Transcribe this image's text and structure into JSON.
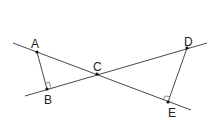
{
  "diagram": {
    "type": "geometry",
    "points": {
      "A": {
        "label": "A",
        "x": 37,
        "y": 52
      },
      "B": {
        "label": "B",
        "x": 47,
        "y": 89
      },
      "C": {
        "label": "C",
        "x": 97,
        "y": 74
      },
      "D": {
        "label": "D",
        "x": 187,
        "y": 48
      },
      "E": {
        "label": "E",
        "x": 168,
        "y": 102
      }
    },
    "lines": [
      {
        "name": "line-AE",
        "through": [
          "A",
          "C",
          "E"
        ]
      },
      {
        "name": "line-BD",
        "through": [
          "B",
          "C",
          "D"
        ]
      }
    ],
    "segments": [
      {
        "name": "segment-AB",
        "from": "A",
        "to": "B"
      },
      {
        "name": "segment-DE",
        "from": "D",
        "to": "E"
      }
    ],
    "right_angles": [
      "B",
      "E"
    ],
    "colors": {
      "stroke": "#333333",
      "point": "#111111",
      "label": "#222222"
    }
  }
}
